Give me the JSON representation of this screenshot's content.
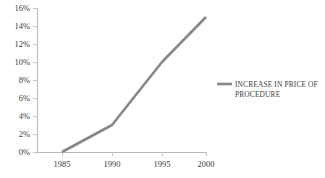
{
  "chart_data": {
    "type": "line",
    "title": "",
    "xlabel": "",
    "ylabel": "",
    "categories": [
      "1985",
      "1990",
      "1995",
      "2000"
    ],
    "x": [
      1985,
      1990,
      1995,
      2000
    ],
    "series": [
      {
        "name": "INCREASE IN PRICE OF PROCEDURE",
        "values": [
          0,
          3,
          10,
          15
        ],
        "color": "#888888"
      }
    ],
    "ylim": [
      0,
      16
    ],
    "yticks": [
      0,
      2,
      4,
      6,
      8,
      10,
      12,
      14,
      16
    ],
    "ytick_labels": [
      "0%",
      "2%",
      "4%",
      "6%",
      "8%",
      "10%",
      "12%",
      "14%",
      "16%"
    ],
    "xtick_labels": [
      "1985",
      "1990",
      "1995",
      "2000"
    ],
    "grid": false,
    "legend_position": "right",
    "legend": [
      {
        "label_line1": "INCREASE IN PRICE OF",
        "label_line2": "PROCEDURE",
        "full_label": "INCREASE IN PRICE OF PROCEDURE",
        "color": "#888888"
      }
    ],
    "axis_color": "#b9b9b9",
    "text_color": "#3c3c3c",
    "background": "#ffffff"
  }
}
